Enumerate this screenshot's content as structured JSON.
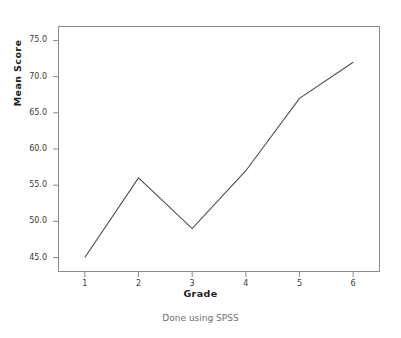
{
  "chart_data": {
    "type": "line",
    "title": "",
    "subtitle": "",
    "xlabel": "Grade",
    "ylabel": "Mean Score",
    "categories": [
      "1",
      "2",
      "3",
      "4",
      "5",
      "6"
    ],
    "values": [
      45,
      56,
      49,
      57,
      67,
      72
    ],
    "series": [
      {
        "name": "Mean Score",
        "values": [
          45,
          56,
          49,
          57,
          67,
          72
        ]
      }
    ],
    "x": [
      1,
      2,
      3,
      4,
      5,
      6
    ],
    "ylim": [
      43,
      77
    ],
    "xlim": [
      0.5,
      6.5
    ],
    "yticks": [
      "45.0",
      "50.0",
      "55.0",
      "60.0",
      "65.0",
      "70.0",
      "75.0"
    ],
    "ytick_values": [
      45,
      50,
      55,
      60,
      65,
      70,
      75
    ],
    "xticks": [
      "1",
      "2",
      "3",
      "4",
      "5",
      "6"
    ],
    "grid": false,
    "legend": "none",
    "annotations": [
      "Done using SPSS"
    ],
    "line_color": "#4d4d4d",
    "frame_color": "#8a8a8a",
    "background_color": "#ffffff"
  },
  "figure": {
    "caption": "Done using SPSS",
    "axis_title_x": "Grade",
    "axis_title_y": "Mean Score"
  }
}
